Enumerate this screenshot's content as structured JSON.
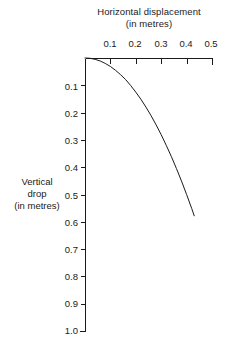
{
  "chart_data": {
    "type": "line",
    "title": "",
    "xlabel": "Horizontal displacement (in metres)",
    "ylabel": "Vertical drop (in metres)",
    "xlabel_line1": "Horizontal displacement",
    "xlabel_line2": "(in metres)",
    "ylabel_line1": "Vertical",
    "ylabel_line2": "drop",
    "ylabel_line3": "(in metres)",
    "xlim": [
      0.0,
      0.5
    ],
    "ylim": [
      0.0,
      1.0
    ],
    "y_axis_inverted": true,
    "x_axis_position": "top",
    "y_axis_position": "left",
    "grid": false,
    "legend": false,
    "xticks": [
      0.1,
      0.2,
      0.3,
      0.4,
      0.5
    ],
    "xticklabels": [
      "0.1",
      "0.2",
      "0.3",
      "0.4",
      "0.5"
    ],
    "yticks": [
      0.1,
      0.2,
      0.3,
      0.4,
      0.5,
      0.6,
      0.7,
      0.8,
      0.9,
      1.0
    ],
    "yticklabels": [
      "0.1",
      "0.2",
      "0.3",
      "0.4",
      "0.5",
      "0.6",
      "0.7",
      "0.8",
      "0.9",
      "1.0"
    ],
    "line_color": "#1a1a1a",
    "axis_color": "#1a1a1a",
    "background_color": "#ffffff",
    "series": [
      {
        "name": "trajectory",
        "x": [
          0.0,
          0.02,
          0.04,
          0.06,
          0.08,
          0.1,
          0.12,
          0.14,
          0.16,
          0.18,
          0.2,
          0.22,
          0.24,
          0.26,
          0.28,
          0.3,
          0.32,
          0.34,
          0.36,
          0.38,
          0.4,
          0.42,
          0.43
        ],
        "values": [
          0.0,
          0.001,
          0.005,
          0.011,
          0.02,
          0.031,
          0.045,
          0.061,
          0.079,
          0.101,
          0.125,
          0.151,
          0.18,
          0.211,
          0.245,
          0.281,
          0.32,
          0.361,
          0.405,
          0.451,
          0.5,
          0.551,
          0.578
        ]
      }
    ]
  },
  "axes_geometry": {
    "origin_x_px": 85,
    "origin_y_px": 58,
    "x_end_px": 212,
    "y_end_px": 331
  }
}
